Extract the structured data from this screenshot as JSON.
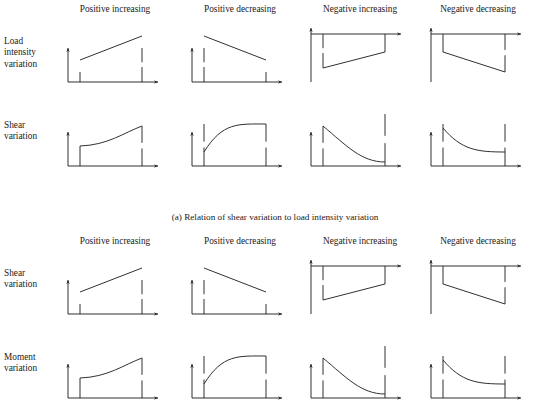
{
  "figure": {
    "title_caption_a": "(a) Relation of shear variation to load intensity variation",
    "columns": [
      {
        "key": "positive-increasing",
        "label": "Positive increasing"
      },
      {
        "key": "positive-decreasing",
        "label": "Positive decreasing"
      },
      {
        "key": "negative-increasing",
        "label": "Negative increasing"
      },
      {
        "key": "negative-decreasing",
        "label": "Negative decreasing"
      }
    ],
    "column_x_centers": [
      115,
      240,
      360,
      478
    ],
    "panel_x_lefts": [
      62,
      186,
      305,
      425
    ],
    "blocks": [
      {
        "key": "block-a",
        "caption": "(a) Relation of shear variation to load intensity variation",
        "rows": [
          {
            "key": "load-intensity-variation",
            "label_lines": [
              "Load",
              "intensity",
              "variation"
            ],
            "kind": "straight",
            "row_top": 26
          },
          {
            "key": "shear-variation",
            "label_lines": [
              "Shear",
              "variation"
            ],
            "kind": "curved",
            "row_top": 110
          }
        ]
      },
      {
        "key": "block-b",
        "caption": "",
        "rows": [
          {
            "key": "shear-variation",
            "label_lines": [
              "Shear",
              "variation"
            ],
            "kind": "straight",
            "row_top": 26
          },
          {
            "key": "moment-variation",
            "label_lines": [
              "Moment",
              "variation"
            ],
            "kind": "curved",
            "row_top": 110
          }
        ]
      }
    ]
  },
  "chart_data": {
    "type": "line",
    "title": "Relation of shear variation to load intensity variation",
    "xlabel": "",
    "ylabel": "",
    "grid": false,
    "legend": "none",
    "panel_geometry": {
      "width": 100,
      "height": 62,
      "axis_origin_x": 6,
      "baseline_y": 56,
      "top_axis_y": 8,
      "plot_left_x": 18,
      "plot_right_x": 80,
      "axis_arrow_x": 96
    },
    "panels": [
      {
        "block": "a",
        "row": "load-intensity-variation",
        "column": "Positive increasing",
        "sign": "positive",
        "trend": "increasing",
        "shape": "straight",
        "axis_position": "bottom",
        "x": [
          18,
          80
        ],
        "y": [
          22,
          46
        ],
        "start_value": 22,
        "end_value": 46,
        "ordinate_ticks": [
          {
            "x": 18,
            "from": 46,
            "to": 56
          },
          {
            "x": 80,
            "from": 22,
            "to": 56
          }
        ]
      },
      {
        "block": "a",
        "row": "load-intensity-variation",
        "column": "Positive decreasing",
        "sign": "positive",
        "trend": "decreasing",
        "shape": "straight",
        "axis_position": "bottom",
        "x": [
          18,
          80
        ],
        "y": [
          46,
          22
        ],
        "start_value": 46,
        "end_value": 22,
        "ordinate_ticks": [
          {
            "x": 18,
            "from": 22,
            "to": 56
          },
          {
            "x": 80,
            "from": 46,
            "to": 56
          }
        ]
      },
      {
        "block": "a",
        "row": "load-intensity-variation",
        "column": "Negative increasing",
        "sign": "negative",
        "trend": "increasing",
        "shape": "straight",
        "axis_position": "top",
        "x": [
          18,
          80
        ],
        "y": [
          -34,
          -18
        ],
        "start_value": -34,
        "end_value": -18,
        "ordinate_ticks": [
          {
            "x": 18,
            "from": 8,
            "to": 42
          },
          {
            "x": 80,
            "from": 8,
            "to": 26
          }
        ]
      },
      {
        "block": "a",
        "row": "load-intensity-variation",
        "column": "Negative decreasing",
        "sign": "negative",
        "trend": "decreasing",
        "shape": "straight",
        "axis_position": "top",
        "x": [
          18,
          80
        ],
        "y": [
          -18,
          -38
        ],
        "start_value": -18,
        "end_value": -38,
        "ordinate_ticks": [
          {
            "x": 18,
            "from": 8,
            "to": 26
          },
          {
            "x": 80,
            "from": 8,
            "to": 46
          }
        ]
      },
      {
        "block": "a",
        "row": "shear-variation",
        "column": "Positive increasing",
        "sign": "positive",
        "trend": "increasing",
        "shape": "curved-concave-up",
        "axis_position": "bottom",
        "x": [
          18,
          80
        ],
        "y": [
          20,
          40
        ],
        "start_value": 20,
        "end_value": 40,
        "ordinate_ticks": [
          {
            "x": 18,
            "from": 36,
            "to": 56
          },
          {
            "x": 80,
            "from": 16,
            "to": 56
          }
        ]
      },
      {
        "block": "a",
        "row": "shear-variation",
        "column": "Positive decreasing",
        "sign": "positive",
        "trend": "increasing",
        "shape": "curved-concave-down",
        "axis_position": "bottom",
        "x": [
          18,
          80
        ],
        "y": [
          14,
          42
        ],
        "start_value": 14,
        "end_value": 42,
        "ordinate_ticks": [
          {
            "x": 18,
            "from": 14,
            "to": 56
          },
          {
            "x": 80,
            "from": 14,
            "to": 56
          }
        ]
      },
      {
        "block": "a",
        "row": "shear-variation",
        "column": "Negative increasing",
        "sign": "negative",
        "trend": "decreasing",
        "shape": "curved-decay",
        "axis_position": "bottom",
        "x": [
          18,
          80
        ],
        "y": [
          40,
          4
        ],
        "start_value": 40,
        "end_value": 4,
        "ordinate_ticks": [
          {
            "x": 18,
            "from": 16,
            "to": 56
          },
          {
            "x": 80,
            "from": 4,
            "to": 56
          }
        ]
      },
      {
        "block": "a",
        "row": "shear-variation",
        "column": "Negative decreasing",
        "sign": "negative",
        "trend": "decreasing",
        "shape": "curved-concave-down",
        "axis_position": "bottom",
        "x": [
          18,
          80
        ],
        "y": [
          38,
          14
        ],
        "start_value": 38,
        "end_value": 14,
        "ordinate_ticks": [
          {
            "x": 18,
            "from": 14,
            "to": 56
          },
          {
            "x": 80,
            "from": 14,
            "to": 56
          }
        ]
      },
      {
        "block": "b",
        "row": "shear-variation",
        "column": "Positive increasing",
        "sign": "positive",
        "trend": "increasing",
        "shape": "straight",
        "axis_position": "bottom",
        "x": [
          18,
          80
        ],
        "y": [
          22,
          46
        ],
        "start_value": 22,
        "end_value": 46,
        "ordinate_ticks": [
          {
            "x": 18,
            "from": 46,
            "to": 56
          },
          {
            "x": 80,
            "from": 22,
            "to": 56
          }
        ]
      },
      {
        "block": "b",
        "row": "shear-variation",
        "column": "Positive decreasing",
        "sign": "positive",
        "trend": "decreasing",
        "shape": "straight",
        "axis_position": "bottom",
        "x": [
          18,
          80
        ],
        "y": [
          46,
          22
        ],
        "start_value": 46,
        "end_value": 22,
        "ordinate_ticks": [
          {
            "x": 18,
            "from": 22,
            "to": 56
          },
          {
            "x": 80,
            "from": 46,
            "to": 56
          }
        ]
      },
      {
        "block": "b",
        "row": "shear-variation",
        "column": "Negative increasing",
        "sign": "negative",
        "trend": "increasing",
        "shape": "straight",
        "axis_position": "top",
        "x": [
          18,
          80
        ],
        "y": [
          -34,
          -18
        ],
        "start_value": -34,
        "end_value": -18,
        "ordinate_ticks": [
          {
            "x": 18,
            "from": 8,
            "to": 42
          },
          {
            "x": 80,
            "from": 8,
            "to": 26
          }
        ]
      },
      {
        "block": "b",
        "row": "shear-variation",
        "column": "Negative decreasing",
        "sign": "negative",
        "trend": "decreasing",
        "shape": "straight",
        "axis_position": "top",
        "x": [
          18,
          80
        ],
        "y": [
          -18,
          -38
        ],
        "start_value": -18,
        "end_value": -38,
        "ordinate_ticks": [
          {
            "x": 18,
            "from": 8,
            "to": 26
          },
          {
            "x": 80,
            "from": 8,
            "to": 46
          }
        ]
      },
      {
        "block": "b",
        "row": "moment-variation",
        "column": "Positive increasing",
        "sign": "positive",
        "trend": "increasing",
        "shape": "curved-concave-up",
        "axis_position": "bottom",
        "x": [
          18,
          80
        ],
        "y": [
          20,
          40
        ],
        "start_value": 20,
        "end_value": 40,
        "ordinate_ticks": [
          {
            "x": 18,
            "from": 36,
            "to": 56
          },
          {
            "x": 80,
            "from": 16,
            "to": 56
          }
        ]
      },
      {
        "block": "b",
        "row": "moment-variation",
        "column": "Positive decreasing",
        "sign": "positive",
        "trend": "increasing",
        "shape": "curved-concave-down",
        "axis_position": "bottom",
        "x": [
          18,
          80
        ],
        "y": [
          14,
          42
        ],
        "start_value": 14,
        "end_value": 42,
        "ordinate_ticks": [
          {
            "x": 18,
            "from": 14,
            "to": 56
          },
          {
            "x": 80,
            "from": 14,
            "to": 56
          }
        ]
      },
      {
        "block": "b",
        "row": "moment-variation",
        "column": "Negative increasing",
        "sign": "negative",
        "trend": "decreasing",
        "shape": "curved-decay",
        "axis_position": "bottom",
        "x": [
          18,
          80
        ],
        "y": [
          40,
          4
        ],
        "start_value": 40,
        "end_value": 4,
        "ordinate_ticks": [
          {
            "x": 18,
            "from": 16,
            "to": 56
          },
          {
            "x": 80,
            "from": 4,
            "to": 56
          }
        ]
      },
      {
        "block": "b",
        "row": "moment-variation",
        "column": "Negative decreasing",
        "sign": "negative",
        "trend": "decreasing",
        "shape": "curved-concave-down",
        "axis_position": "bottom",
        "x": [
          18,
          80
        ],
        "y": [
          38,
          14
        ],
        "start_value": 38,
        "end_value": 14,
        "ordinate_ticks": [
          {
            "x": 18,
            "from": 14,
            "to": 56
          },
          {
            "x": 80,
            "from": 14,
            "to": 56
          }
        ]
      }
    ]
  },
  "style": {
    "line_color": "#1a1a1a",
    "axis_color": "#1a1a1a",
    "background": "#ffffff"
  }
}
